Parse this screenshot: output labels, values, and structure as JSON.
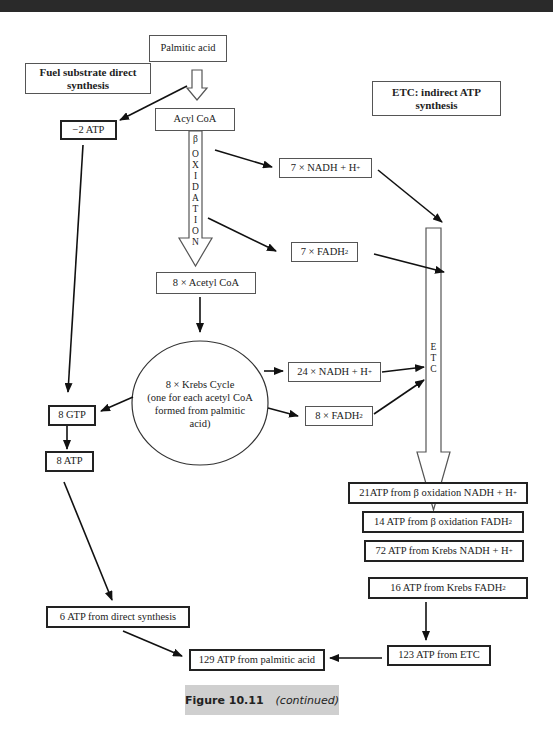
{
  "header": {
    "text": ""
  },
  "nodes": {
    "palmitic_acid": "Palmitic acid",
    "fuel_substrate": "Fuel substrate direct synthesis",
    "etc_indirect": "ETC: indirect ATP synthesis",
    "acyl_coa": "Acyl CoA",
    "minus_2_atp": "−2 ATP",
    "nadh_7": "7 × NADH + H",
    "nadh_7_sup": "+",
    "fadh_7": "7 × FADH",
    "fadh_7_sub": "2",
    "acetyl_coa_8": "8 × Acetyl CoA",
    "krebs_line1": "8 × Krebs Cycle",
    "krebs_line2": "(one for each acetyl CoA",
    "krebs_line3": "formed from palmitic",
    "krebs_line4": "acid)",
    "nadh_24": "24 × NADH + H",
    "nadh_24_sup": "+",
    "fadh_8": "8 × FADH",
    "fadh_8_sub": "2",
    "gtp_8": "8 GTP",
    "atp_8": "8 ATP",
    "atp_21": "21ATP from β oxidation NADH + H",
    "atp_21_sup": "+",
    "atp_14": "14 ATP from β oxidation FADH",
    "atp_14_sub": "2",
    "atp_72": "72 ATP from Krebs NADH + H",
    "atp_72_sup": "+",
    "atp_16": "16 ATP from Krebs FADH",
    "atp_16_sub": "2",
    "atp_6": "6 ATP from direct synthesis",
    "atp_123": "123 ATP from ETC",
    "atp_129": "129 ATP from palmitic acid"
  },
  "beta_oxidation_label": [
    "β",
    "O",
    "X",
    "I",
    "D",
    "A",
    "T",
    "I",
    "O",
    "N"
  ],
  "etc_label": [
    "E",
    "T",
    "C"
  ],
  "caption": {
    "figure": "Figure 10.11",
    "note": "(continued)"
  }
}
